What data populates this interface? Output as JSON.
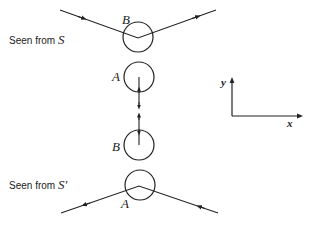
{
  "figure": {
    "top_panel": {
      "caption_prefix": "Seen from",
      "frame": "S",
      "upper_particle": "B",
      "lower_particle": "A"
    },
    "bottom_panel": {
      "caption_prefix": "Seen from",
      "frame": "S'",
      "upper_particle": "B",
      "lower_particle": "A"
    },
    "axes": {
      "y_label": "y",
      "x_label": "x"
    },
    "colors": {
      "ink": "#222222",
      "background": "#ffffff"
    }
  }
}
